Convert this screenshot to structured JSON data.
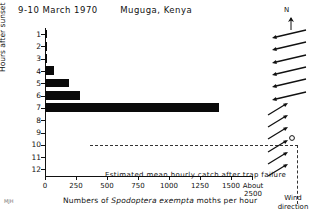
{
  "title": {
    "date": "9-10 March 1970",
    "place": "Muguga, Kenya"
  },
  "chart_data": {
    "type": "bar",
    "orientation": "horizontal",
    "title": "9-10 March 1970  Muguga, Kenya",
    "xlabel": "Numbers of Spodoptera exempta moths per hour",
    "ylabel": "Hours after sunset",
    "categories": [
      "1",
      "2",
      "3",
      "4",
      "5",
      "6",
      "7",
      "8",
      "9",
      "10",
      "11",
      "12"
    ],
    "values": [
      18,
      14,
      12,
      70,
      190,
      280,
      1400,
      0,
      0,
      0,
      0,
      0
    ],
    "xlim": [
      0,
      2500
    ],
    "ylim_categories_top_to_bottom": true,
    "xticks": [
      0,
      250,
      500,
      750,
      1000,
      1250,
      1500
    ],
    "xtick_labels": [
      "0",
      "250",
      "500",
      "750",
      "1000",
      "1250",
      "1500"
    ],
    "axis_break_label_line1": "About",
    "axis_break_label_line2": "2500",
    "grid": false,
    "legend": "none",
    "annotation": "Estimated mean hourly catch after trap failure",
    "annotation_region": "dashed box spanning hours 8-12 to About 2500"
  },
  "xaxis": {
    "label_prefix": "Numbers of ",
    "species": "Spodoptera exempta",
    "label_suffix": " moths per hour",
    "ticks": [
      {
        "value": 0,
        "label": "0"
      },
      {
        "value": 250,
        "label": "250"
      },
      {
        "value": 500,
        "label": "500"
      },
      {
        "value": 750,
        "label": "750"
      },
      {
        "value": 1000,
        "label": "1000"
      },
      {
        "value": 1250,
        "label": "1250"
      },
      {
        "value": 1500,
        "label": "1500"
      }
    ],
    "break_label": "About",
    "break_value": "2500"
  },
  "yaxis": {
    "title": "Hours after sunset",
    "labels": [
      "1",
      "2",
      "3",
      "4",
      "5",
      "6",
      "7",
      "8",
      "9",
      "10",
      "11",
      "12"
    ]
  },
  "annotation": "Estimated mean hourly catch after trap failure",
  "wind": {
    "north_label": "N",
    "caption_line1": "Wind",
    "caption_line2": "direction",
    "rows": [
      {
        "hour": "1",
        "glyph": "arrow-left-down",
        "bearing_deg": 260
      },
      {
        "hour": "2",
        "glyph": "arrow-left-down",
        "bearing_deg": 258
      },
      {
        "hour": "3",
        "glyph": "arrow-left-down",
        "bearing_deg": 255
      },
      {
        "hour": "4",
        "glyph": "arrow-left-down",
        "bearing_deg": 255
      },
      {
        "hour": "5",
        "glyph": "arrow-left-down",
        "bearing_deg": 252
      },
      {
        "hour": "6",
        "glyph": "arrow-left-down",
        "bearing_deg": 250
      },
      {
        "hour": "7",
        "glyph": "arrow-up-right",
        "bearing_deg": 45
      },
      {
        "hour": "8",
        "glyph": "arrow-up-right",
        "bearing_deg": 50
      },
      {
        "hour": "9",
        "glyph": "arrow-calm-circle",
        "bearing_deg": 55
      },
      {
        "hour": "10",
        "glyph": "arrow-up-right",
        "bearing_deg": 45
      },
      {
        "hour": "11",
        "glyph": "arrow-up-right",
        "bearing_deg": 48
      },
      {
        "hour": "12",
        "glyph": "arrow-up-right",
        "bearing_deg": 50
      }
    ]
  },
  "corner_mark": "MJH",
  "colors": {
    "bar": "#0a0a0a",
    "axis": "#111111",
    "dashed": "#333333",
    "background": "#ffffff"
  }
}
